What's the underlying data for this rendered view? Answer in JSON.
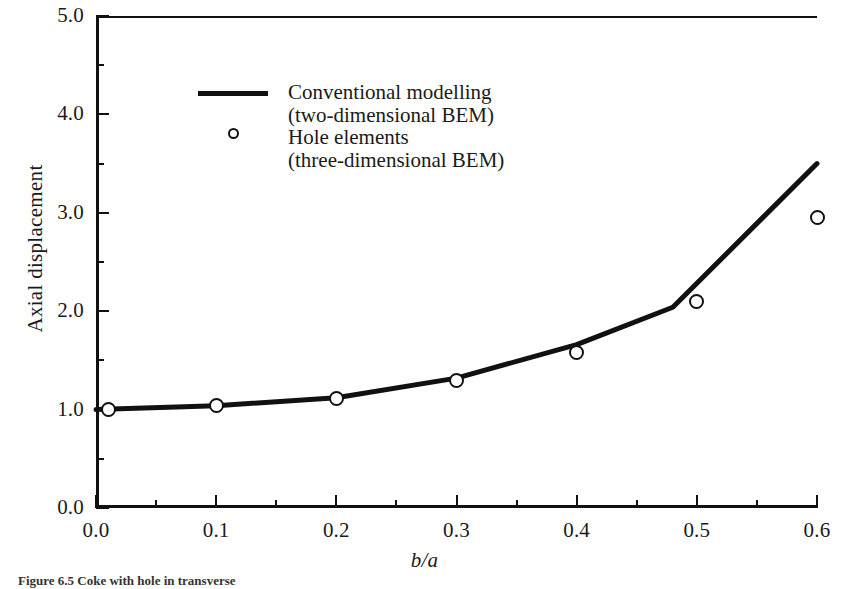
{
  "chart_data": {
    "type": "line",
    "title": "",
    "xlabel": "b/a",
    "ylabel": "Axial displacement",
    "xlim": [
      0.0,
      0.6
    ],
    "ylim": [
      0.0,
      5.0
    ],
    "xticks": [
      "0.0",
      "0.1",
      "0.2",
      "0.3",
      "0.4",
      "0.5",
      "0.6"
    ],
    "xtick_values": [
      0.0,
      0.1,
      0.2,
      0.3,
      0.4,
      0.5,
      0.6
    ],
    "xminor_values": [
      0.05,
      0.15,
      0.25,
      0.35,
      0.45,
      0.55
    ],
    "yticks": [
      "0.0",
      "1.0",
      "2.0",
      "3.0",
      "4.0",
      "5.0"
    ],
    "ytick_values": [
      0.0,
      1.0,
      2.0,
      3.0,
      4.0,
      5.0
    ],
    "yminor_values": [
      0.5,
      1.5,
      2.5,
      3.5,
      4.5
    ],
    "grid": false,
    "legend_position": "upper-center-left",
    "series": [
      {
        "name": "Conventional modelling (two-dimensional BEM)",
        "style": "line",
        "x": [
          0.0,
          0.1,
          0.2,
          0.3,
          0.4,
          0.48,
          0.6
        ],
        "values": [
          1.0,
          1.04,
          1.12,
          1.32,
          1.66,
          2.04,
          3.5
        ]
      },
      {
        "name": "Hole elements (three-dimensional BEM)",
        "style": "markers",
        "x": [
          0.01,
          0.1,
          0.2,
          0.3,
          0.4,
          0.5,
          0.6
        ],
        "values": [
          1.0,
          1.04,
          1.11,
          1.3,
          1.58,
          2.1,
          2.95
        ]
      }
    ]
  },
  "legend": {
    "line_label_1": "Conventional modelling",
    "line_label_2": "(two-dimensional BEM)",
    "marker_label_1": "Hole elements",
    "marker_label_2": "(three-dimensional BEM)",
    "line_swatch_icon": "solid-line-swatch",
    "marker_swatch_icon": "open-circle-swatch"
  },
  "axes": {
    "y_title": "Axial displacement",
    "x_title": "b/a"
  },
  "caption": {
    "text": "Figure 6.5  Coke with hole in transverse"
  },
  "colors": {
    "line": "#111111",
    "marker_stroke": "#111111",
    "marker_fill": "#ffffff",
    "axis": "#111111",
    "background": "#ffffff"
  }
}
